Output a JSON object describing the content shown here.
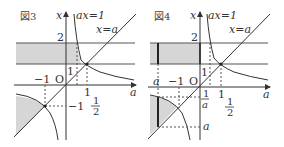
{
  "figures": [
    {
      "title": "図3",
      "axis_vertical_label": "x",
      "axis_horizontal_label": "a",
      "curve_label": "ax=1",
      "line_label": "x=a",
      "tick_2": "2",
      "tick_1_vertical": "1",
      "tick_1_horizontal": "1",
      "tick_minus1_horizontal": "−1",
      "tick_minus1_vertical": "−1",
      "origin_label": "O",
      "half_num": "1",
      "half_den": "2",
      "colors": {
        "shade": "#d6d6d6",
        "line": "#333333"
      }
    },
    {
      "title": "図4",
      "axis_vertical_label": "x",
      "axis_horizontal_label": "a",
      "curve_label": "ax=1",
      "line_label": "x=a",
      "tick_2": "2",
      "tick_1_vertical": "1",
      "tick_1_horizontal": "1",
      "tick_a_horizontal": "a",
      "tick_minus1_horizontal": "−1",
      "origin_label": "O",
      "inv_a_num": "1",
      "inv_a_den": "a",
      "tick_a_vertical": "a",
      "half_num": "1",
      "half_den": "2",
      "colors": {
        "shade": "#d6d6d6",
        "line": "#333333"
      }
    }
  ]
}
